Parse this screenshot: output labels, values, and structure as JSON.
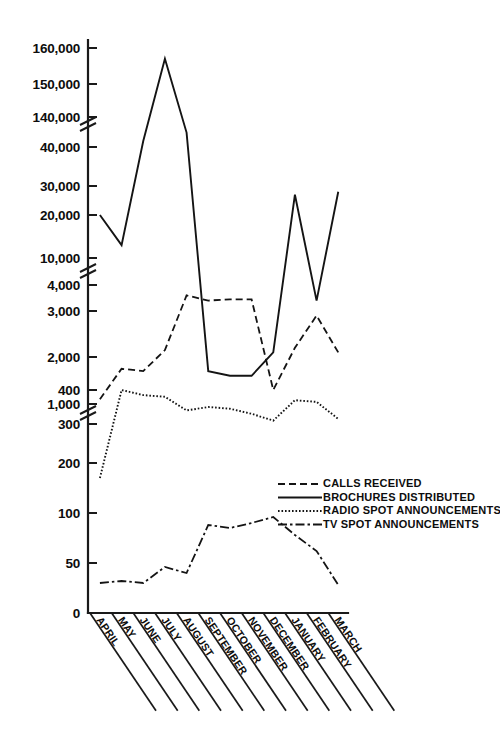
{
  "chart_data": {
    "type": "line",
    "title": "",
    "subtitle": "",
    "xlabel": "",
    "ylabel": "",
    "grid": false,
    "legend_position": "right-middle",
    "axis_note": "Broken (segmented) y-axis with three scale bands and two break marks",
    "categories": [
      "APRIL",
      "MAY",
      "JUNE",
      "JULY",
      "AUGUST",
      "SEPTEMBER",
      "OCTOBER",
      "NOVEMBER",
      "DECEMBER",
      "JANUARY",
      "FEBRUARY",
      "MARCH"
    ],
    "y_axis": {
      "tick_labels": [
        "0",
        "50",
        "100",
        "200",
        "300",
        "400",
        "1,000",
        "2,000",
        "3,000",
        "4,000",
        "10,000",
        "20,000",
        "30,000",
        "40,000",
        "140,000",
        "150,000",
        "160,000"
      ],
      "segments": [
        {
          "name": "low",
          "min": 0,
          "max": 400,
          "ticks": [
            0,
            50,
            100,
            200,
            300,
            400
          ]
        },
        {
          "name": "mid",
          "min": 1000,
          "max": 4000,
          "ticks": [
            1000,
            2000,
            3000,
            4000
          ]
        },
        {
          "name": "high",
          "min": 10000,
          "max": 160000,
          "ticks": [
            10000,
            20000,
            30000,
            40000,
            140000,
            150000,
            160000
          ]
        }
      ]
    },
    "series": [
      {
        "name": "CALLS RECEIVED",
        "style": "dashed",
        "values": [
          1100,
          1750,
          1700,
          2150,
          3600,
          3400,
          3450,
          3450,
          1300,
          2200,
          2900,
          2100
        ]
      },
      {
        "name": "BROCHURES DISTRIBUTED",
        "style": "solid",
        "values": [
          20000,
          13000,
          60000,
          157000,
          88000,
          1700,
          1600,
          1600,
          2100,
          27000,
          3400,
          28000
        ]
      },
      {
        "name": "RADIO SPOT ANNOUNCEMENTS",
        "style": "dotted",
        "values": [
          170,
          400,
          385,
          380,
          340,
          350,
          345,
          330,
          310,
          370,
          365,
          315
        ]
      },
      {
        "name": "TV SPOT ANNOUNCEMENTS",
        "style": "dash-dot",
        "values": [
          30,
          32,
          30,
          46,
          40,
          88,
          85,
          90,
          96,
          78,
          62,
          28
        ]
      }
    ]
  },
  "legend": {
    "entries": [
      {
        "label": "CALLS RECEIVED",
        "style": "dashed"
      },
      {
        "label": "BROCHURES DISTRIBUTED",
        "style": "solid"
      },
      {
        "label": "RADIO SPOT ANNOUNCEMENTS",
        "style": "dotted"
      },
      {
        "label": "TV SPOT ANNOUNCEMENTS",
        "style": "dash-dot"
      }
    ]
  },
  "colors": {
    "ink": "#141414",
    "background": "#ffffff"
  }
}
